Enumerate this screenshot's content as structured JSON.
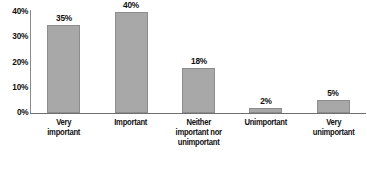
{
  "chart_data": {
    "type": "bar",
    "title": "",
    "subtitle": "",
    "xlabel": "",
    "ylabel": "",
    "categories": [
      "Very important",
      "Important",
      "Neither important nor unimportant",
      "Unimportant",
      "Very unimportant"
    ],
    "values": [
      35,
      40,
      18,
      2,
      5
    ],
    "data_labels": [
      "35%",
      "40%",
      "18%",
      "2%",
      "5%"
    ],
    "ylim": [
      0,
      40
    ],
    "y_ticks": [
      0,
      10,
      20,
      30,
      40
    ],
    "y_tick_labels": [
      "0%",
      "10%",
      "20%",
      "30%",
      "40%"
    ],
    "grid": false,
    "legend": null,
    "bar_color": "#a8a8a8",
    "bar_border_color": "#8d8d8d",
    "axis_color": "#6f6f6f",
    "text_color": "#111111",
    "background_color": "#ffffff",
    "category_lines": [
      [
        "Very",
        "important"
      ],
      [
        "Important"
      ],
      [
        "Neither",
        "important nor",
        "unimportant"
      ],
      [
        "Unimportant"
      ],
      [
        "Very",
        "unimportant"
      ]
    ]
  }
}
